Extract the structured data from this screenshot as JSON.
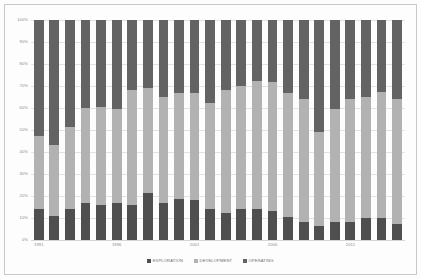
{
  "chart_data": {
    "type": "bar",
    "subtype": "stacked-percentage-column",
    "title": "",
    "subtitle": "",
    "xlabel": "",
    "ylabel": "",
    "ylim": [
      0,
      100
    ],
    "yunit": "%",
    "grid": true,
    "legend_position": "bottom",
    "categories": [
      "1991",
      "1992",
      "1993",
      "1994",
      "1995",
      "1996",
      "1997",
      "1998",
      "1999",
      "2000",
      "2001",
      "2002",
      "2003",
      "2004",
      "2005",
      "2006",
      "2007",
      "2008",
      "2009",
      "2010",
      "2011",
      "2012",
      "2013",
      "2014"
    ],
    "x_tick_labels": [
      "1991",
      "1996",
      "2001",
      "2006",
      "2011"
    ],
    "y_tick_labels": [
      "0%",
      "10%",
      "20%",
      "30%",
      "40%",
      "50%",
      "60%",
      "70%",
      "80%",
      "90%",
      "100%"
    ],
    "y_tick_values": [
      0,
      10,
      20,
      30,
      40,
      50,
      60,
      70,
      80,
      90,
      100
    ],
    "series": [
      {
        "name": "EXPLORATION",
        "color": "#4f4f4f",
        "values": [
          14,
          11,
          14,
          17,
          16,
          17,
          16,
          21.5,
          17,
          18.5,
          18,
          14,
          12.5,
          14,
          14,
          13,
          10.5,
          8,
          6.5,
          8,
          8,
          10,
          10,
          7.5
        ]
      },
      {
        "name": "DEVELOPMENT",
        "color": "#b2b2b2",
        "values": [
          33.5,
          32,
          37.5,
          43,
          44.5,
          42.5,
          52,
          47.5,
          48,
          48.5,
          49,
          48.5,
          55.5,
          56,
          58.5,
          59,
          56.5,
          56,
          42.5,
          51.5,
          56,
          55,
          57.5,
          56.5
        ]
      },
      {
        "name": "OPERATING",
        "color": "#636363",
        "values": [
          52.5,
          57,
          48.5,
          40,
          39.5,
          40.5,
          32,
          31,
          35,
          33,
          33,
          37.5,
          32,
          30,
          27.5,
          28,
          33,
          36,
          51,
          40.5,
          36,
          35,
          32.5,
          36
        ]
      }
    ]
  },
  "legend": {
    "items": [
      {
        "label": "EXPLORATION",
        "color": "#4f4f4f"
      },
      {
        "label": "DEVELOPMENT",
        "color": "#b2b2b2"
      },
      {
        "label": "OPERATING",
        "color": "#636363"
      }
    ]
  }
}
